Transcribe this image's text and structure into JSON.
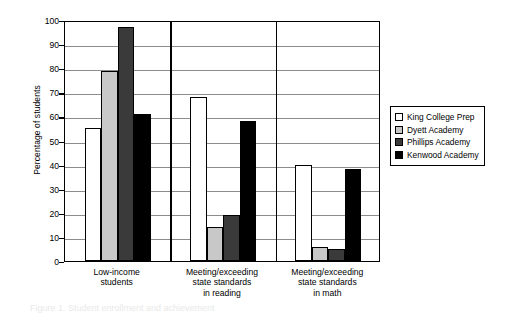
{
  "chart_data": {
    "type": "bar",
    "title": "",
    "xlabel": "",
    "ylabel": "Percentage of students",
    "ylim": [
      0,
      100
    ],
    "ytick_step": 10,
    "yticks": [
      0,
      10,
      20,
      30,
      40,
      50,
      60,
      70,
      80,
      90,
      100
    ],
    "grid": true,
    "legend_position": "right",
    "categories": [
      "Low-income students",
      "Meeting/exceeding state standards in reading",
      "Meeting/exceeding state standards in math"
    ],
    "category_lines": [
      [
        "Low-income",
        "students"
      ],
      [
        "Meeting/exceeding",
        "state standards",
        "in reading"
      ],
      [
        "Meeting/exceeding",
        "state standards",
        "in math"
      ]
    ],
    "series": [
      {
        "name": "King College Prep",
        "color": "#ffffff",
        "values": [
          55,
          68,
          40
        ]
      },
      {
        "name": "Dyett Academy",
        "color": "#c8c8c8",
        "values": [
          79,
          14,
          6
        ]
      },
      {
        "name": "Phillips Academy",
        "color": "#3a3a3a",
        "values": [
          97,
          19,
          5
        ]
      },
      {
        "name": "Kenwood Academy",
        "color": "#000000",
        "values": [
          61,
          58,
          38
        ]
      }
    ]
  },
  "legend": {
    "items": [
      {
        "label": "King College Prep",
        "color": "#ffffff"
      },
      {
        "label": "Dyett Academy",
        "color": "#c8c8c8"
      },
      {
        "label": "Phillips Academy",
        "color": "#3a3a3a"
      },
      {
        "label": "Kenwood Academy",
        "color": "#000000"
      }
    ]
  },
  "caption": "Figure 1. Student enrollment and achievement"
}
